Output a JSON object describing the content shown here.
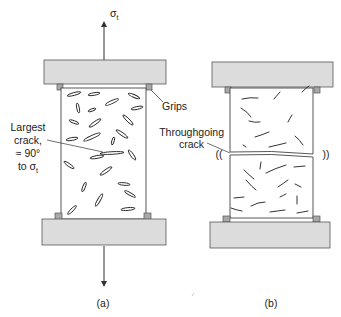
{
  "figure": {
    "panel_a": {
      "caption": "(a)",
      "stress_symbol": "σ",
      "stress_subscript": "t",
      "label_largest_crack_line1": "Largest",
      "label_largest_crack_line2": "crack,",
      "label_largest_crack_line3": "≈ 90°",
      "label_largest_crack_line4_prefix": "to σ",
      "label_largest_crack_line4_sub": "t",
      "label_grips": "Grips"
    },
    "panel_b": {
      "caption": "(b)",
      "label_throughgoing_line1": "Throughgoing",
      "label_throughgoing_line2": "crack",
      "vibration_left": "((",
      "vibration_right": "))"
    },
    "colors": {
      "block_fill": "#dcdcdc",
      "grip_fill": "#a8a8a8",
      "line": "#333333"
    }
  }
}
